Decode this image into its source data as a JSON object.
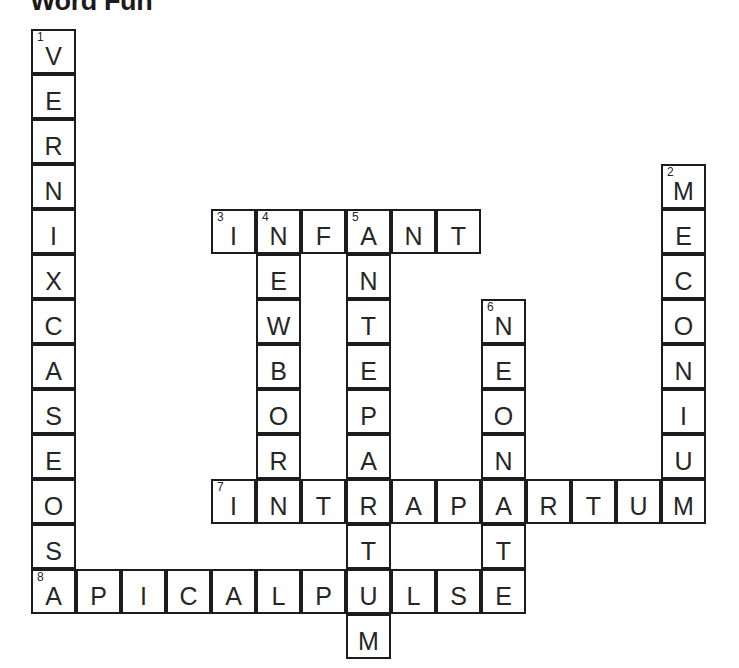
{
  "title": "Word Fun",
  "grid": {
    "origin_x": 32,
    "origin_y": 30,
    "cell_size": 45,
    "columns": 15,
    "rows": 14
  },
  "entries": [
    {
      "number": "1",
      "direction": "down",
      "answer": "VERNIXCASEOSA",
      "display": "VERNIX CASEOSA",
      "length": 13,
      "col": 1,
      "row": 1
    },
    {
      "number": "2",
      "direction": "down",
      "answer": "MECONIUM",
      "display": "MECONIUM",
      "length": 8,
      "col": 15,
      "row": 4
    },
    {
      "number": "3",
      "direction": "across",
      "answer": "INFANT",
      "display": "INFANT",
      "length": 6,
      "col": 5,
      "row": 5
    },
    {
      "number": "4",
      "direction": "down",
      "answer": "NEWBORN",
      "display": "NEWBORN",
      "length": 7,
      "col": 6,
      "row": 5
    },
    {
      "number": "5",
      "direction": "down",
      "answer": "ANTEPARTUM",
      "display": "ANTEPARTUM",
      "length": 10,
      "col": 8,
      "row": 5
    },
    {
      "number": "6",
      "direction": "down",
      "answer": "NEONATE",
      "display": "NEONATE",
      "length": 7,
      "col": 11,
      "row": 7
    },
    {
      "number": "7",
      "direction": "across",
      "answer": "INTRAPARTUM",
      "display": "INTRAPARTUM",
      "length": 11,
      "col": 5,
      "row": 11
    },
    {
      "number": "8",
      "direction": "across",
      "answer": "APICALPULSE",
      "display": "APICAL PULSE",
      "length": 11,
      "col": 1,
      "row": 13
    }
  ],
  "cells": [
    {
      "col": 1,
      "row": 1,
      "letter": "V",
      "number": "1"
    },
    {
      "col": 1,
      "row": 2,
      "letter": "E",
      "number": ""
    },
    {
      "col": 1,
      "row": 3,
      "letter": "R",
      "number": ""
    },
    {
      "col": 1,
      "row": 4,
      "letter": "N",
      "number": ""
    },
    {
      "col": 1,
      "row": 5,
      "letter": "I",
      "number": ""
    },
    {
      "col": 1,
      "row": 6,
      "letter": "X",
      "number": ""
    },
    {
      "col": 1,
      "row": 7,
      "letter": "C",
      "number": ""
    },
    {
      "col": 1,
      "row": 8,
      "letter": "A",
      "number": ""
    },
    {
      "col": 1,
      "row": 9,
      "letter": "S",
      "number": ""
    },
    {
      "col": 1,
      "row": 10,
      "letter": "E",
      "number": ""
    },
    {
      "col": 1,
      "row": 11,
      "letter": "O",
      "number": ""
    },
    {
      "col": 1,
      "row": 12,
      "letter": "S",
      "number": ""
    },
    {
      "col": 1,
      "row": 13,
      "letter": "A",
      "number": "8"
    },
    {
      "col": 15,
      "row": 4,
      "letter": "M",
      "number": "2"
    },
    {
      "col": 15,
      "row": 5,
      "letter": "E",
      "number": ""
    },
    {
      "col": 15,
      "row": 6,
      "letter": "C",
      "number": ""
    },
    {
      "col": 15,
      "row": 7,
      "letter": "O",
      "number": ""
    },
    {
      "col": 15,
      "row": 8,
      "letter": "N",
      "number": ""
    },
    {
      "col": 15,
      "row": 9,
      "letter": "I",
      "number": ""
    },
    {
      "col": 15,
      "row": 10,
      "letter": "U",
      "number": ""
    },
    {
      "col": 15,
      "row": 11,
      "letter": "M",
      "number": ""
    },
    {
      "col": 5,
      "row": 5,
      "letter": "I",
      "number": "3"
    },
    {
      "col": 6,
      "row": 5,
      "letter": "N",
      "number": "4"
    },
    {
      "col": 7,
      "row": 5,
      "letter": "F",
      "number": ""
    },
    {
      "col": 8,
      "row": 5,
      "letter": "A",
      "number": "5"
    },
    {
      "col": 9,
      "row": 5,
      "letter": "N",
      "number": ""
    },
    {
      "col": 10,
      "row": 5,
      "letter": "T",
      "number": ""
    },
    {
      "col": 6,
      "row": 6,
      "letter": "E",
      "number": ""
    },
    {
      "col": 6,
      "row": 7,
      "letter": "W",
      "number": ""
    },
    {
      "col": 6,
      "row": 8,
      "letter": "B",
      "number": ""
    },
    {
      "col": 6,
      "row": 9,
      "letter": "O",
      "number": ""
    },
    {
      "col": 6,
      "row": 10,
      "letter": "R",
      "number": ""
    },
    {
      "col": 6,
      "row": 11,
      "letter": "N",
      "number": ""
    },
    {
      "col": 8,
      "row": 6,
      "letter": "N",
      "number": ""
    },
    {
      "col": 8,
      "row": 7,
      "letter": "T",
      "number": ""
    },
    {
      "col": 8,
      "row": 8,
      "letter": "E",
      "number": ""
    },
    {
      "col": 8,
      "row": 9,
      "letter": "P",
      "number": ""
    },
    {
      "col": 8,
      "row": 10,
      "letter": "A",
      "number": ""
    },
    {
      "col": 8,
      "row": 11,
      "letter": "R",
      "number": ""
    },
    {
      "col": 8,
      "row": 12,
      "letter": "T",
      "number": ""
    },
    {
      "col": 8,
      "row": 13,
      "letter": "U",
      "number": ""
    },
    {
      "col": 8,
      "row": 14,
      "letter": "M",
      "number": ""
    },
    {
      "col": 11,
      "row": 7,
      "letter": "N",
      "number": "6"
    },
    {
      "col": 11,
      "row": 8,
      "letter": "E",
      "number": ""
    },
    {
      "col": 11,
      "row": 9,
      "letter": "O",
      "number": ""
    },
    {
      "col": 11,
      "row": 10,
      "letter": "N",
      "number": ""
    },
    {
      "col": 11,
      "row": 11,
      "letter": "A",
      "number": ""
    },
    {
      "col": 11,
      "row": 12,
      "letter": "T",
      "number": ""
    },
    {
      "col": 11,
      "row": 13,
      "letter": "E",
      "number": ""
    },
    {
      "col": 5,
      "row": 11,
      "letter": "I",
      "number": "7"
    },
    {
      "col": 7,
      "row": 11,
      "letter": "T",
      "number": ""
    },
    {
      "col": 9,
      "row": 11,
      "letter": "A",
      "number": ""
    },
    {
      "col": 10,
      "row": 11,
      "letter": "P",
      "number": ""
    },
    {
      "col": 12,
      "row": 11,
      "letter": "R",
      "number": ""
    },
    {
      "col": 13,
      "row": 11,
      "letter": "T",
      "number": ""
    },
    {
      "col": 14,
      "row": 11,
      "letter": "U",
      "number": ""
    },
    {
      "col": 2,
      "row": 13,
      "letter": "P",
      "number": ""
    },
    {
      "col": 3,
      "row": 13,
      "letter": "I",
      "number": ""
    },
    {
      "col": 4,
      "row": 13,
      "letter": "C",
      "number": ""
    },
    {
      "col": 5,
      "row": 13,
      "letter": "A",
      "number": ""
    },
    {
      "col": 6,
      "row": 13,
      "letter": "L",
      "number": ""
    },
    {
      "col": 7,
      "row": 13,
      "letter": "P",
      "number": ""
    },
    {
      "col": 9,
      "row": 13,
      "letter": "L",
      "number": ""
    },
    {
      "col": 10,
      "row": 13,
      "letter": "S",
      "number": ""
    }
  ]
}
